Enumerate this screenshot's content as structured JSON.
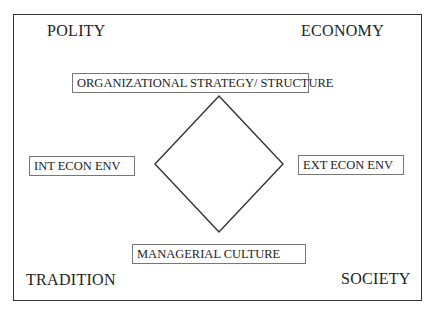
{
  "diagram": {
    "corners": {
      "top_left": "POLITY",
      "top_right": "ECONOMY",
      "bottom_left": "TRADITION",
      "bottom_right": "SOCIETY"
    },
    "boxes": {
      "top": "ORGANIZATIONAL STRATEGY/ STRUCTURE",
      "left": "INT ECON ENV",
      "right": "EXT ECON ENV",
      "bottom": "MANAGERIAL CULTURE"
    },
    "center_shape": "diamond",
    "colors": {
      "line": "#333333",
      "box_border": "#777777",
      "text": "#222222"
    }
  }
}
